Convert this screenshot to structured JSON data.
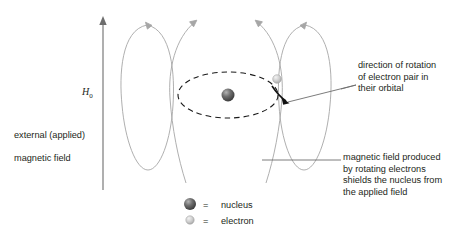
{
  "figure": {
    "title_fragment": "",
    "field_label": {
      "symbol": "H",
      "subscript": "0",
      "description_line1": "external (applied)",
      "description_line2": "magnetic field"
    },
    "annotations": {
      "rotation": "direction of rotation\nof electron pair in\ntheir orbital",
      "shielding": "magnetic field produced\nby rotating electrons\nshields the nucleus from\nthe applied field"
    },
    "legend": {
      "equals": "=",
      "items": [
        {
          "marker": "nucleus-sphere",
          "label": "nucleus"
        },
        {
          "marker": "electron-sphere",
          "label": "electron"
        }
      ]
    },
    "colors": {
      "background": "#ffffff",
      "text": "#231f20",
      "field_line": "#9a9a9a",
      "orbital_dash": "#1a1a1a",
      "nucleus_dark": "#4a4a4a",
      "nucleus_light": "#9d9d9d",
      "electron_dark": "#b8b8b8",
      "electron_light": "#e4e4e4",
      "leader_line": "#6d6d6d"
    },
    "geometry": {
      "h0_arrow": {
        "x": 103,
        "y_top": 18,
        "y_bottom": 190
      },
      "orbital_ellipse": {
        "cx": 228,
        "cy": 95,
        "rx": 50,
        "ry": 23
      },
      "nucleus": {
        "cx": 228,
        "cy": 95,
        "r": 6.5
      },
      "electron": {
        "cx": 277,
        "cy": 79,
        "r": 4.2
      },
      "field_loops": 4
    }
  }
}
